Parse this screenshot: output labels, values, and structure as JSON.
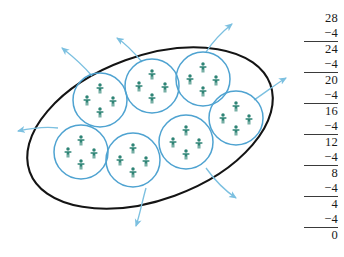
{
  "figure": {
    "group_count": 7,
    "people_per_group": 4,
    "total_people": 28,
    "colors": {
      "oval_stroke": "#1a1a1a",
      "group_circle_stroke": "#4FA3D1",
      "person": "#2E8475",
      "arrow": "#7CC0E0"
    },
    "oval": {
      "cx": 150,
      "cy": 128,
      "rx": 128,
      "ry": 72,
      "rotation": -20
    },
    "groups": [
      {
        "name": "group-1",
        "cx": 100,
        "cy": 100,
        "r": 27
      },
      {
        "name": "group-2",
        "cx": 152,
        "cy": 86,
        "r": 27
      },
      {
        "name": "group-3",
        "cx": 203,
        "cy": 79,
        "r": 27
      },
      {
        "name": "group-4",
        "cx": 236,
        "cy": 118,
        "r": 27
      },
      {
        "name": "group-5",
        "cx": 186,
        "cy": 142,
        "r": 27
      },
      {
        "name": "group-6",
        "cx": 133,
        "cy": 160,
        "r": 27
      },
      {
        "name": "group-7",
        "cx": 81,
        "cy": 152,
        "r": 27
      }
    ],
    "arrows": [
      {
        "name": "arrow-out-top-left",
        "d": "M 92 76 C 80 62 72 56 62 48",
        "label": "group leaving upper-left"
      },
      {
        "name": "arrow-out-top-mid",
        "d": "M 142 62 C 132 50 126 44 117 38",
        "label": "group leaving top"
      },
      {
        "name": "arrow-out-top-right",
        "d": "M 206 52 C 214 40 222 32 232 24",
        "label": "group leaving upper-right"
      },
      {
        "name": "arrow-out-right",
        "d": "M 254 100 C 266 92 276 84 286 78",
        "label": "group leaving right"
      },
      {
        "name": "arrow-out-left",
        "d": "M 58 128 C 44 126 32 128 18 131",
        "label": "group leaving left"
      },
      {
        "name": "arrow-out-bottom-right",
        "d": "M 206 168 C 216 182 224 190 236 198",
        "label": "group leaving lower-right"
      },
      {
        "name": "arrow-out-bottom",
        "d": "M 146 188 C 142 202 140 214 136 226",
        "label": "group leaving bottom"
      }
    ]
  },
  "calculation": {
    "title": "repeated subtraction of 4 from 28",
    "steps": [
      {
        "value": "28",
        "ruled": false,
        "y": 12
      },
      {
        "value": "−4",
        "ruled": true,
        "y": 27
      },
      {
        "value": "24",
        "ruled": false,
        "y": 43
      },
      {
        "value": "−4",
        "ruled": true,
        "y": 58
      },
      {
        "value": "20",
        "ruled": false,
        "y": 74
      },
      {
        "value": "−4",
        "ruled": true,
        "y": 89
      },
      {
        "value": "16",
        "ruled": false,
        "y": 105
      },
      {
        "value": "−4",
        "ruled": true,
        "y": 120
      },
      {
        "value": "12",
        "ruled": false,
        "y": 136
      },
      {
        "value": "−4",
        "ruled": true,
        "y": 151
      },
      {
        "value": "8",
        "ruled": false,
        "y": 167
      },
      {
        "value": "−4",
        "ruled": true,
        "y": 182
      },
      {
        "value": "4",
        "ruled": false,
        "y": 198
      },
      {
        "value": "−4",
        "ruled": true,
        "y": 213
      },
      {
        "value": "0",
        "ruled": false,
        "y": 229
      }
    ]
  }
}
